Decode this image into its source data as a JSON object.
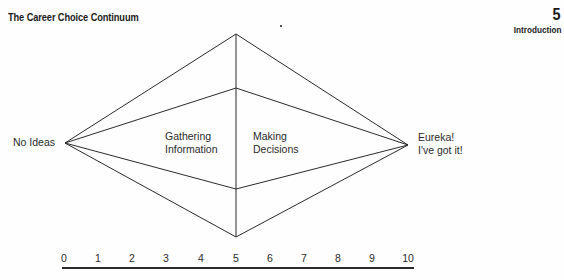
{
  "header": {
    "title": "The Career Choice Continuum",
    "page_number": "5",
    "section": "Introduction"
  },
  "diagram": {
    "left_label": "No Ideas",
    "right_label_line1": "Eureka!",
    "right_label_line2": "I've got it!",
    "inner_left_line1": "Gathering",
    "inner_left_line2": "Information",
    "inner_right_line1": "Making",
    "inner_right_line2": "Decisions",
    "stroke_color": "#2a2a2a"
  },
  "axis": {
    "ticks": [
      "0",
      "1",
      "2",
      "3",
      "4",
      "5",
      "6",
      "7",
      "8",
      "9",
      "10"
    ]
  }
}
